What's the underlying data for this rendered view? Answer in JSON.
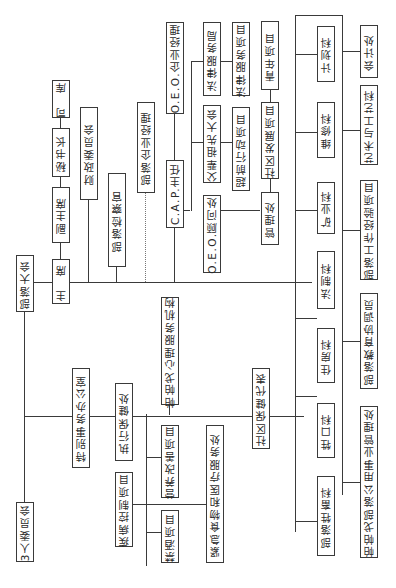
{
  "nodes": {
    "tribal_assembly": "部落大会",
    "chairman": "主　席",
    "vice_chairman": "副主席",
    "secretary_general": "秘书长",
    "treasurer": "司　库",
    "finance_committee": "财政委员会",
    "tribal_prosecutor": "部落检察官",
    "tribal_enterprise_manager": "部落企业经理",
    "cap_director": "C.A.P.主任",
    "oeo_enterprise_manager": "O.E.O.企业经理",
    "oeo_advisor": "O.E.O.顾问处",
    "legal_services_bureau": "法律服务局",
    "legal_services_project": "法律服务项目",
    "parents_ancestors_assembly": "父辈祖先大会",
    "head_start_project": "超前行动项目",
    "youth_project": "青年项目",
    "community_development_project": "社区发展项目",
    "management_office": "管理处",
    "planning_section": "计划科",
    "accounting_office": "会计处",
    "maintenance_section": "维修科",
    "arts_crafts_section": "艺术与工艺科",
    "mining_section": "矿业科",
    "tribal_work_experience_project": "部落工作经验项目",
    "legal_section": "法制科",
    "tribal_education_coordinator": "部落教育协调员",
    "housing_section": "住房科",
    "livestock_section": "牲口科",
    "papago_utility_authority": "帕帕戈部落公用事业管理处",
    "tribal_livestock_section": "部落牲畜科",
    "special_affairs_office": "特别事务办公室",
    "executive_health_office": "执行保健处",
    "papago_mental_health": "帕帕戈心理服务机构",
    "nutrition_project": "营养改善项目",
    "disease_control_project": "疾病控制项目",
    "alcohol_project": "禁酒项目",
    "emergency_food_medical": "紧急食物和医疗服务处",
    "community_health_rep": "社区保健代表",
    "three_person_committee": "3人委员会"
  }
}
